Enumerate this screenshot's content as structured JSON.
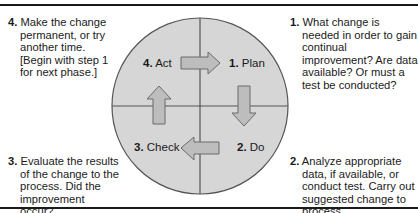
{
  "title_partial": "",
  "colors": {
    "circle_fill": "#d6d6d6",
    "circle_stroke": "#555555",
    "arrow_fill": "#bdbdbd",
    "arrow_stroke": "#6a6a6a",
    "rule": "#1a1a1a"
  },
  "quadrants": [
    {
      "step": "1.",
      "label": "Plan"
    },
    {
      "step": "2.",
      "label": "Do"
    },
    {
      "step": "3.",
      "label": "Check"
    },
    {
      "step": "4.",
      "label": "Act"
    }
  ],
  "descriptions": [
    {
      "step": "1.",
      "text": "What change is needed in order to gain continual improvement? Are data available? Or must a test be conducted?"
    },
    {
      "step": "2.",
      "text": "Analyze appropriate data, if available, or conduct test. Carry out suggested change to process."
    },
    {
      "step": "3.",
      "text": "Evaluate the results of the change to the process. Did the improvement occur?"
    },
    {
      "step": "4.",
      "text": "Make the change permanent, or try another time. [Begin with step 1 for next phase.]"
    }
  ],
  "arrows": [
    {
      "from": "Act",
      "to": "Plan",
      "direction": "right"
    },
    {
      "from": "Plan",
      "to": "Do",
      "direction": "down"
    },
    {
      "from": "Do",
      "to": "Check",
      "direction": "left"
    },
    {
      "from": "Check",
      "to": "Act",
      "direction": "up"
    }
  ]
}
